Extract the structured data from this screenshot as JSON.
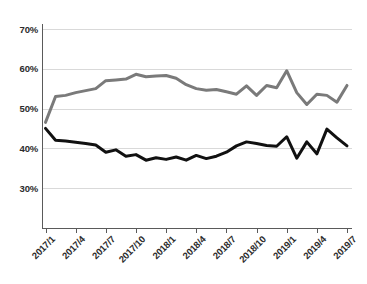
{
  "chart_data": {
    "type": "line",
    "title": "",
    "subtitle": "",
    "xlabel": "",
    "ylabel": "",
    "grid": true,
    "legend": "none",
    "ylim": [
      20,
      70
    ],
    "ytick_labels": [
      "70%",
      "60%",
      "50%",
      "40%",
      "30%"
    ],
    "ytick_values": [
      70,
      60,
      50,
      40,
      30
    ],
    "xtick_labels": [
      "2017/1",
      "2017/4",
      "2017/7",
      "2017/10",
      "2018/1",
      "2018/4",
      "2018/7",
      "2018/10",
      "2019/1",
      "2019/4",
      "2019/7"
    ],
    "x": [
      "2017/1",
      "2017/2",
      "2017/3",
      "2017/4",
      "2017/5",
      "2017/6",
      "2017/7",
      "2017/8",
      "2017/9",
      "2017/10",
      "2017/11",
      "2017/12",
      "2018/1",
      "2018/2",
      "2018/3",
      "2018/4",
      "2018/5",
      "2018/6",
      "2018/7",
      "2018/8",
      "2018/9",
      "2018/10",
      "2018/11",
      "2018/12",
      "2019/1",
      "2019/2",
      "2019/3",
      "2019/4",
      "2019/5",
      "2019/6",
      "2019/7"
    ],
    "series": [
      {
        "name": "upper-series",
        "color": "#7a7a7a",
        "values": [
          46.5,
          53.0,
          53.3,
          54.0,
          54.5,
          55.0,
          57.0,
          57.2,
          57.4,
          58.6,
          58.0,
          58.2,
          58.3,
          57.6,
          56.0,
          55.0,
          54.6,
          54.8,
          54.2,
          53.6,
          55.7,
          53.3,
          55.8,
          55.2,
          59.5,
          54.0,
          51.0,
          53.6,
          53.3,
          51.6,
          55.8
        ]
      },
      {
        "name": "lower-series",
        "color": "#111111",
        "values": [
          45.0,
          42.0,
          41.8,
          41.5,
          41.2,
          40.8,
          39.0,
          39.6,
          38.0,
          38.4,
          37.0,
          37.6,
          37.2,
          37.8,
          37.0,
          38.2,
          37.4,
          38.0,
          39.0,
          40.6,
          41.6,
          41.2,
          40.7,
          40.5,
          42.9,
          37.5,
          41.6,
          38.6,
          44.8,
          42.6,
          40.6
        ]
      }
    ]
  },
  "axes": {
    "y_axis_name": "percent-axis",
    "x_axis_name": "time-axis"
  }
}
